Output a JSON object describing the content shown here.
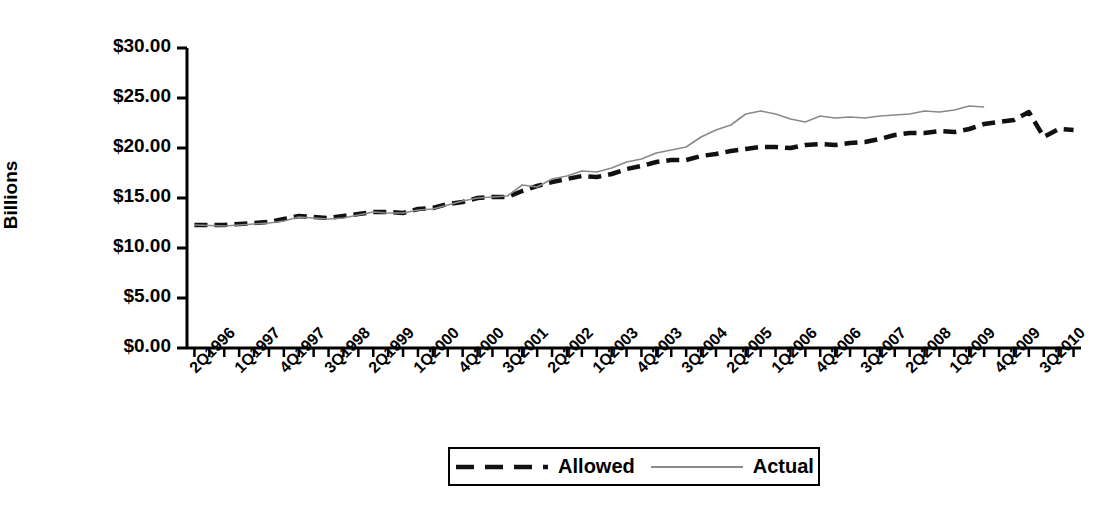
{
  "chart_data": {
    "type": "line",
    "title": "",
    "xlabel": "",
    "ylabel": "Billions",
    "ylim": [
      0,
      30
    ],
    "ytick_labels": [
      "$30.00",
      "$25.00",
      "$20.00",
      "$15.00",
      "$10.00",
      "$5.00",
      "$0.00"
    ],
    "ytick_values": [
      30,
      25,
      20,
      15,
      10,
      5,
      0
    ],
    "grid": false,
    "legend_position": "bottom-center",
    "x": [
      "2Q1996",
      "3Q1996",
      "4Q1996",
      "1Q1997",
      "2Q1997",
      "3Q1997",
      "4Q1997",
      "1Q1998",
      "2Q1998",
      "3Q1998",
      "4Q1998",
      "1Q1999",
      "2Q1999",
      "3Q1999",
      "4Q1999",
      "1Q2000",
      "2Q2000",
      "3Q2000",
      "4Q2000",
      "1Q2001",
      "2Q2001",
      "3Q2001",
      "4Q2001",
      "1Q2002",
      "2Q2002",
      "3Q2002",
      "4Q2002",
      "1Q2003",
      "2Q2003",
      "3Q2003",
      "4Q2003",
      "1Q2004",
      "2Q2004",
      "3Q2004",
      "4Q2004",
      "1Q2005",
      "2Q2005",
      "3Q2005",
      "4Q2005",
      "1Q2006",
      "2Q2006",
      "3Q2006",
      "4Q2006",
      "1Q2007",
      "2Q2007",
      "3Q2007",
      "4Q2007",
      "1Q2008",
      "2Q2008",
      "3Q2008",
      "4Q2008",
      "1Q2009",
      "2Q2009",
      "3Q2009",
      "4Q2009",
      "1Q2010",
      "2Q2010",
      "3Q2010",
      "4Q2010",
      "1Q2011"
    ],
    "xtick_labels": [
      "2Q1996",
      "1Q1997",
      "4Q1997",
      "3Q1998",
      "2Q1999",
      "1Q2000",
      "4Q2000",
      "3Q2001",
      "2Q2002",
      "1Q2003",
      "4Q2003",
      "3Q2004",
      "2Q2005",
      "1Q2006",
      "4Q2006",
      "3Q2007",
      "2Q2008",
      "1Q2009",
      "4Q2009",
      "3Q2010"
    ],
    "xtick_label_every": 3,
    "series": [
      {
        "name": "Allowed",
        "style": "dashed",
        "color": "#111111",
        "width": 4.5,
        "values": [
          12.3,
          12.3,
          12.3,
          12.4,
          12.5,
          12.6,
          12.9,
          13.2,
          13.1,
          13.0,
          13.2,
          13.4,
          13.6,
          13.6,
          13.5,
          13.9,
          14.0,
          14.4,
          14.6,
          15.0,
          15.1,
          15.1,
          15.7,
          16.2,
          16.6,
          16.9,
          17.2,
          17.1,
          17.4,
          17.9,
          18.2,
          18.6,
          18.8,
          18.8,
          19.2,
          19.4,
          19.7,
          19.9,
          20.1,
          20.1,
          20.0,
          20.3,
          20.4,
          20.3,
          20.5,
          20.6,
          20.9,
          21.3,
          21.5,
          21.5,
          21.7,
          21.6,
          21.9,
          22.4,
          22.6,
          22.8,
          23.6,
          21.1,
          21.9,
          21.8
        ]
      },
      {
        "name": "Actual",
        "style": "solid",
        "color": "#8a8a8a",
        "width": 1.6,
        "values": [
          12.3,
          12.25,
          12.2,
          12.3,
          12.4,
          12.5,
          12.7,
          13.1,
          13.0,
          12.9,
          13.0,
          13.3,
          13.6,
          13.5,
          13.5,
          13.8,
          13.9,
          14.3,
          14.7,
          15.0,
          15.1,
          15.2,
          16.3,
          16.1,
          16.9,
          17.2,
          17.7,
          17.6,
          18.0,
          18.6,
          18.9,
          19.5,
          19.8,
          20.1,
          21.1,
          21.8,
          22.3,
          23.4,
          23.7,
          23.4,
          22.9,
          22.6,
          23.2,
          23.0,
          23.1,
          23.0,
          23.2,
          23.3,
          23.4,
          23.7,
          23.6,
          23.8,
          24.2,
          24.1,
          null,
          null,
          null,
          null,
          null,
          null
        ]
      }
    ]
  },
  "legend": {
    "items": [
      {
        "label": "Allowed",
        "marker": "dashed-line-swatch"
      },
      {
        "label": "Actual",
        "marker": "solid-line-swatch"
      }
    ]
  }
}
